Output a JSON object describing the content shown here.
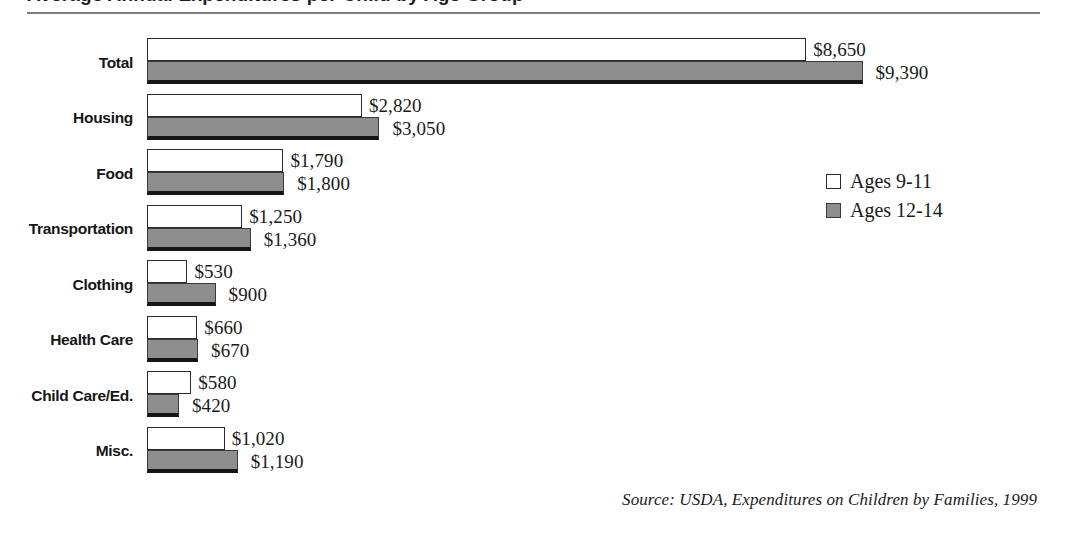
{
  "header": {
    "title_clipped": "Average Annual Expenditures per Child by Age Group",
    "rule_color": "#7d7d7d"
  },
  "legend": {
    "position": "right-middle",
    "items": [
      {
        "label": "Ages 9-11",
        "swatch": "light-swatch",
        "color": "#ffffff"
      },
      {
        "label": "Ages 12-14",
        "swatch": "dark-swatch",
        "color": "#8e8e8e"
      }
    ]
  },
  "source": {
    "text": "Source: USDA, Expenditures on Children by Families, 1999"
  },
  "chart_data": {
    "type": "bar",
    "orientation": "horizontal",
    "title": "Average Annual Expenditures per Child by Age Group",
    "xlabel": "",
    "ylabel": "",
    "xlim": [
      0,
      9390
    ],
    "grid": false,
    "legend_position": "right",
    "categories": [
      "Total",
      "Housing",
      "Food",
      "Transportation",
      "Clothing",
      "Health Care",
      "Child Care/Ed.",
      "Misc."
    ],
    "series": [
      {
        "name": "Ages 9-11",
        "color": "#ffffff",
        "values": [
          8650,
          2820,
          1790,
          1250,
          530,
          660,
          580,
          1020
        ],
        "labels": [
          "$8,650",
          "$2,820",
          "$1,790",
          "$1,250",
          "$530",
          "$660",
          "$580",
          "$1,020"
        ]
      },
      {
        "name": "Ages 12-14",
        "color": "#8e8e8e",
        "values": [
          9390,
          3050,
          1800,
          1360,
          900,
          670,
          420,
          1190
        ],
        "labels": [
          "$9,390",
          "$3,050",
          "$1,800",
          "$1,360",
          "$900",
          "$670",
          "$420",
          "$1,190"
        ]
      }
    ],
    "annotations": [
      "Source: USDA, Expenditures on Children by Families, 1999"
    ]
  }
}
